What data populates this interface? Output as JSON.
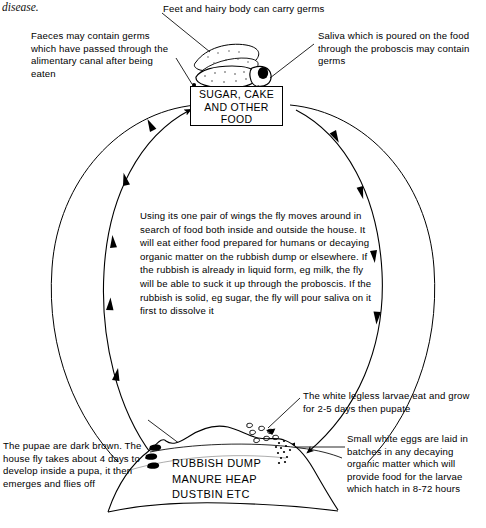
{
  "page": {
    "fragment_text": "disease.",
    "background_color": "#ffffff",
    "ink_color": "#000000",
    "width": 486,
    "height": 528
  },
  "annotations": {
    "feet": "Feet and hairy body can carry germs",
    "faeces": "Faeces may contain germs which have passed through the alimentary canal after being eaten",
    "saliva": "Saliva which is poured on the food through the proboscis may contain germs",
    "central": "Using its one pair of wings the fly moves around in search of food both inside and outside the house. It will eat either food prepared for humans or decaying organic matter on the rubbish dump or elsewhere. If the rubbish is already in liquid form, eg milk, the fly will be able to suck it up through the proboscis. If the rubbish is solid, eg sugar, the fly will pour saliva on it first to dissolve it",
    "larvae": "The white legless larvae eat and grow for 2-5 days then pupate",
    "eggs": "Small white eggs are laid in batches in any decaying organic matter which will provide food for the larvae which hatch in 8-72 hours",
    "pupae": "The pupae are dark brown. The house fly takes about 4 days to develop inside a pupa, it then emerges and flies off"
  },
  "labels": {
    "food_box": "SUGAR, CAKE\nAND\nOTHER FOOD",
    "rubbish_dump": "RUBBISH DUMP\nMANURE HEAP\nDUSTBIN ETC"
  },
  "life_stages": {
    "egg_duration": "8-72 hours",
    "larva_duration": "2-5 days",
    "pupa_duration": "4 days"
  },
  "figures": {
    "fly": "housefly-illustration",
    "dump": "rubbish-dump-mound",
    "eggs_cluster": "egg-batch-dots",
    "larvae_cluster": "larvae-maggot-shapes",
    "pupae_cluster": "dark-pupae-shapes"
  },
  "flow": {
    "outer_cycle": "outer-ellipse-path",
    "inner_left_arc": "arc-dump-to-food-left",
    "inner_right_arc": "arc-food-to-dump-right"
  }
}
